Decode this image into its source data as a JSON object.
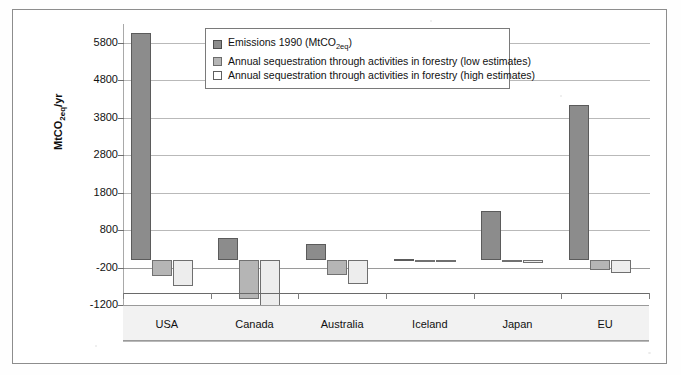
{
  "figure": {
    "background_color": "#ffffff",
    "frame_color": "#8d8d8d"
  },
  "chart_data": {
    "type": "bar",
    "title": "",
    "xlabel": "",
    "ylabel": "MtCO2eq/yr",
    "ylabel_rich": "MtCO",
    "ylabel_sub": "2eq",
    "ylabel_tail": "/yr",
    "categories": [
      "USA",
      "Canada",
      "Australia",
      "Iceland",
      "Japan",
      "EU"
    ],
    "ylim": [
      -1200,
      6300
    ],
    "yticks": [
      -1200,
      -200,
      800,
      1800,
      2800,
      3800,
      4800,
      5800
    ],
    "ytick_labels": [
      "-1200",
      "-200",
      "800",
      "1800",
      "2800",
      "3800",
      "4800",
      "5800"
    ],
    "grid": true,
    "legend_position": "upper-center",
    "series": [
      {
        "name": "Emissions 1990 (MtCO2eq)",
        "key": "emissions",
        "color": "#8c8c8c",
        "values": [
          6050,
          600,
          420,
          15,
          1300,
          4150
        ]
      },
      {
        "name": "Annual sequestration through activities in forestry (low estimates)",
        "key": "low",
        "color": "#b5b5b5",
        "values": [
          -430,
          -1030,
          -390,
          -5,
          -60,
          -260
        ]
      },
      {
        "name": "Annual sequestration through activities in forestry (high estimates)",
        "key": "high",
        "color": "#ededed",
        "values": [
          -680,
          -1450,
          -640,
          -10,
          -85,
          -340
        ]
      }
    ]
  },
  "legend": {
    "items": [
      {
        "label_main": "Emissions 1990 (MtCO",
        "label_sub": "2eq",
        "label_tail": ")",
        "swatch": "emissions"
      },
      {
        "label_main": "Annual sequestration through activities in forestry (low estimates)",
        "label_sub": "",
        "label_tail": "",
        "swatch": "low"
      },
      {
        "label_main": "Annual sequestration through activities in forestry (high estimates)",
        "label_sub": "",
        "label_tail": "",
        "swatch": "high"
      }
    ]
  }
}
